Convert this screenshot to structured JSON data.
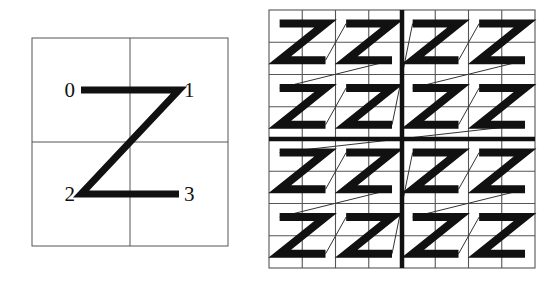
{
  "figure": {
    "name": "z-order-curve-figure",
    "caption": "",
    "background_color": "#ffffff",
    "ink_color": "#111111",
    "grid_color": "#555555",
    "connector_color": "#333333",
    "width": 555,
    "height": 286
  },
  "left_panel": {
    "name": "basic-z-order-panel",
    "description": "Order-1 Z-order (Morton) curve on a 2x2 grid",
    "frame": {
      "x": 32,
      "y": 38,
      "width": 196,
      "height": 208
    },
    "grid": {
      "rows": 2,
      "cols": 2,
      "line_width": 1
    },
    "curve": {
      "stroke_width": 7,
      "points": [
        {
          "label": "0",
          "x": 0.25,
          "y": 0.25
        },
        {
          "label": "1",
          "x": 0.75,
          "y": 0.25
        },
        {
          "label": "2",
          "x": 0.25,
          "y": 0.75
        },
        {
          "label": "3",
          "x": 0.75,
          "y": 0.75
        }
      ]
    },
    "labels": [
      {
        "text": "0",
        "anchor": "end",
        "dx": -6,
        "dy": 7
      },
      {
        "text": "1",
        "anchor": "start",
        "dx": 5,
        "dy": 7
      },
      {
        "text": "2",
        "anchor": "end",
        "dx": -6,
        "dy": 7
      },
      {
        "text": "3",
        "anchor": "start",
        "dx": 5,
        "dy": 7
      }
    ]
  },
  "right_panel": {
    "name": "recursive-z-order-panel",
    "description": "Order-2 Z-order (Morton) curve: 16 Z glyphs on an 8x8 grid, quadrants split by heavy rules",
    "frame": {
      "x": 14,
      "y": 10,
      "width": 266,
      "height": 258
    },
    "grid": {
      "rows": 8,
      "cols": 8,
      "thin_line_width": 1.1,
      "thick_line_width": 4.5,
      "quadrant_divider_row": 4,
      "quadrant_divider_col": 4
    },
    "glyph": {
      "stroke_width": 8,
      "count": 16,
      "order": [
        {
          "index": 0,
          "block_col": 0,
          "block_row": 0
        },
        {
          "index": 1,
          "block_col": 1,
          "block_row": 0
        },
        {
          "index": 2,
          "block_col": 0,
          "block_row": 1
        },
        {
          "index": 3,
          "block_col": 1,
          "block_row": 1
        },
        {
          "index": 4,
          "block_col": 2,
          "block_row": 0
        },
        {
          "index": 5,
          "block_col": 3,
          "block_row": 0
        },
        {
          "index": 6,
          "block_col": 2,
          "block_row": 1
        },
        {
          "index": 7,
          "block_col": 3,
          "block_row": 1
        },
        {
          "index": 8,
          "block_col": 0,
          "block_row": 2
        },
        {
          "index": 9,
          "block_col": 1,
          "block_row": 2
        },
        {
          "index": 10,
          "block_col": 0,
          "block_row": 3
        },
        {
          "index": 11,
          "block_col": 1,
          "block_row": 3
        },
        {
          "index": 12,
          "block_col": 2,
          "block_row": 2
        },
        {
          "index": 13,
          "block_col": 3,
          "block_row": 2
        },
        {
          "index": 14,
          "block_col": 2,
          "block_row": 3
        },
        {
          "index": 15,
          "block_col": 3,
          "block_row": 3
        }
      ]
    },
    "connectors": {
      "stroke_width": 1,
      "count": 15
    }
  }
}
